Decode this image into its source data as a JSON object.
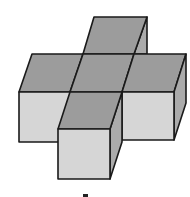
{
  "figure": {
    "cube_count": 5,
    "label": ""
  },
  "colors": {
    "top_face": "#9c9c9c",
    "front_face": "#d6d6d6",
    "side_face": "#ababab",
    "edge": "#1a1a1a",
    "background": "#ffffff"
  },
  "faces": {
    "back_top": "94,17 147,17 134,54 83,54",
    "back_side": "134,54 147,17 147,54",
    "left_top": "32,54 83,54 70,92 19,92",
    "center_top": "83,54 134,54 122,92 70,92",
    "right_top": "134,54 186,54 174,92 122,92",
    "left_front": "19,92 70,92 70,142 19,142",
    "right_front": "122,92 174,92 174,140 122,140",
    "right_side": "174,92 186,54 186,103 174,140",
    "front_top": "70,92 122,92 110,129 58,129",
    "front_front": "58,129 110,129 110,179 58,179",
    "front_side": "110,129 122,92 122,142 110,179"
  }
}
